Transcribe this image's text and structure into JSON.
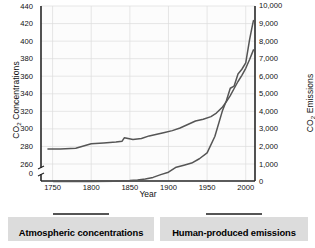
{
  "chart_data": {
    "type": "line",
    "title": "",
    "xlabel": "Year",
    "ylabel_left": "CO2 Concentrations",
    "ylabel_right_line1": "CO2 Emissions",
    "ylabel_right_line2": "(Million Metric Tons Carbon)",
    "xlim": [
      1735,
      2012
    ],
    "xticks": [
      1750,
      1800,
      1850,
      1900,
      1950,
      2000
    ],
    "xticklabels": [
      "1750",
      "1800",
      "1850",
      "1900",
      "1950",
      "2000"
    ],
    "ylim_left": [
      255,
      440
    ],
    "yticks_left": [
      0,
      260,
      280,
      300,
      320,
      340,
      360,
      380,
      400,
      420,
      440
    ],
    "yticklabels_left": [
      "0",
      "260",
      "280",
      "300",
      "320",
      "340",
      "360",
      "380",
      "400",
      "420",
      "440"
    ],
    "ylim_right": [
      0,
      10000
    ],
    "yticks_right": [
      0,
      1000,
      2000,
      3000,
      4000,
      5000,
      6000,
      7000,
      8000,
      9000,
      10000
    ],
    "yticklabels_right": [
      "0",
      "1,000",
      "2,000",
      "3,000",
      "4,000",
      "5,000",
      "6,000",
      "7,000",
      "8,000",
      "9,000",
      "10,000"
    ],
    "grid": true,
    "legend_position": "below",
    "axis_break_left": true,
    "line_color": "#555555",
    "grid_color": "#dcdcdc",
    "axis_color": "#262626",
    "series": [
      {
        "name": "Atmospheric concentrations",
        "axis": "left",
        "units": "ppm",
        "x": [
          1744,
          1760,
          1780,
          1800,
          1816,
          1832,
          1840,
          1843,
          1854,
          1865,
          1875,
          1885,
          1895,
          1905,
          1915,
          1925,
          1935,
          1945,
          1955,
          1962,
          1970,
          1975,
          1980,
          1985,
          1990,
          1995,
          2000,
          2005,
          2010
        ],
        "values": [
          277,
          277,
          278,
          283,
          284,
          285,
          286,
          290,
          288,
          289,
          292,
          294,
          296,
          298,
          301,
          305,
          309,
          311,
          314,
          318,
          325,
          331,
          338,
          346,
          354,
          361,
          369,
          379,
          390
        ]
      },
      {
        "name": "Human-produced emissions",
        "axis": "right",
        "units": "million metric tons carbon",
        "x": [
          1751,
          1800,
          1830,
          1850,
          1860,
          1870,
          1880,
          1890,
          1900,
          1910,
          1920,
          1930,
          1940,
          1950,
          1960,
          1970,
          1975,
          1980,
          1985,
          1990,
          1995,
          2000,
          2005,
          2008,
          2010
        ],
        "values": [
          3,
          8,
          24,
          54,
          91,
          148,
          236,
          396,
          534,
          819,
          932,
          1053,
          1299,
          1630,
          2569,
          4053,
          4615,
          5316,
          5438,
          6127,
          6397,
          6765,
          8086,
          8749,
          9167
        ]
      }
    ]
  },
  "legend": {
    "items": [
      {
        "label": "Atmospheric concentrations"
      },
      {
        "label": "Human-produced emissions"
      }
    ]
  }
}
